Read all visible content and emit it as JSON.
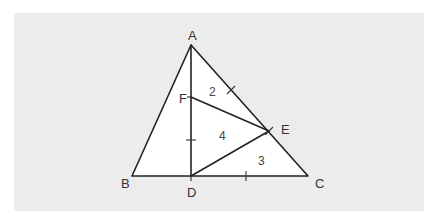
{
  "diagram": {
    "type": "geometry-triangle",
    "background_color": "#ececec",
    "triangle_fill": "#ffffff",
    "line_color": "#222222",
    "points": {
      "A": {
        "label": "A",
        "x": 191,
        "y": 45
      },
      "B": {
        "label": "B",
        "x": 132,
        "y": 176
      },
      "C": {
        "label": "C",
        "x": 308,
        "y": 176
      },
      "D": {
        "label": "D",
        "x": 191,
        "y": 176
      },
      "E": {
        "label": "E",
        "x": 269,
        "y": 131
      },
      "F": {
        "label": "F",
        "x": 191,
        "y": 97
      }
    },
    "segments": [
      "AB",
      "BC",
      "CA",
      "AD",
      "FE",
      "ED"
    ],
    "tick_marks": [
      {
        "on": "AE",
        "x": 231,
        "y": 90
      },
      {
        "on": "FD",
        "x": 191,
        "y": 140
      },
      {
        "on": "DC",
        "x": 246,
        "y": 176
      },
      {
        "on": "E",
        "x": 269,
        "y": 131
      }
    ],
    "area_labels": [
      {
        "region": "triangle AFE",
        "value": "2"
      },
      {
        "region": "triangle FDE",
        "value": "4"
      },
      {
        "region": "triangle EDC",
        "value": "3"
      }
    ]
  }
}
